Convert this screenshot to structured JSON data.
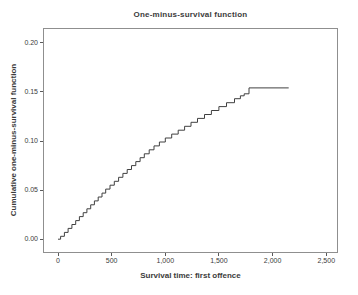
{
  "colors": {
    "curve": "#404040",
    "frame": "#8f8f8f",
    "tick": "#5a5a5a",
    "text": "#3b3b3b",
    "background": "#ffffff"
  },
  "chart_data": {
    "type": "line",
    "subtype": "step-function",
    "title": "One-minus-survival function",
    "xlabel": "Survival time: first offence",
    "ylabel": "Cumulative one-minus-survival function",
    "grid": false,
    "legend": null,
    "xlim": [
      -130,
      2600
    ],
    "ylim": [
      -0.013,
      0.214
    ],
    "x_ticks": [
      {
        "value": 0,
        "label": "0"
      },
      {
        "value": 500,
        "label": "500"
      },
      {
        "value": 1000,
        "label": "1,000"
      },
      {
        "value": 1500,
        "label": "1,500"
      },
      {
        "value": 2000,
        "label": "2,000"
      },
      {
        "value": 2500,
        "label": "2,500"
      }
    ],
    "y_ticks": [
      {
        "value": 0.0,
        "label": "0.00"
      },
      {
        "value": 0.05,
        "label": "0.05"
      },
      {
        "value": 0.1,
        "label": "0.10"
      },
      {
        "value": 0.15,
        "label": "0.15"
      },
      {
        "value": 0.2,
        "label": "0.20"
      }
    ],
    "series": [
      {
        "name": "One-minus-survival function",
        "style": "step-after",
        "points": [
          [
            0,
            0.0
          ],
          [
            25,
            0.003
          ],
          [
            60,
            0.007
          ],
          [
            95,
            0.011
          ],
          [
            130,
            0.015
          ],
          [
            165,
            0.019
          ],
          [
            200,
            0.023
          ],
          [
            235,
            0.027
          ],
          [
            270,
            0.031
          ],
          [
            305,
            0.035
          ],
          [
            340,
            0.039
          ],
          [
            375,
            0.043
          ],
          [
            410,
            0.047
          ],
          [
            445,
            0.051
          ],
          [
            485,
            0.055
          ],
          [
            525,
            0.059
          ],
          [
            565,
            0.063
          ],
          [
            605,
            0.067
          ],
          [
            645,
            0.071
          ],
          [
            685,
            0.075
          ],
          [
            725,
            0.079
          ],
          [
            765,
            0.083
          ],
          [
            805,
            0.087
          ],
          [
            850,
            0.091
          ],
          [
            895,
            0.095
          ],
          [
            945,
            0.099
          ],
          [
            1000,
            0.103
          ],
          [
            1060,
            0.107
          ],
          [
            1120,
            0.111
          ],
          [
            1180,
            0.115
          ],
          [
            1240,
            0.119
          ],
          [
            1300,
            0.123
          ],
          [
            1365,
            0.127
          ],
          [
            1430,
            0.131
          ],
          [
            1500,
            0.135
          ],
          [
            1570,
            0.139
          ],
          [
            1645,
            0.143
          ],
          [
            1700,
            0.146
          ],
          [
            1735,
            0.148
          ],
          [
            1780,
            0.154
          ],
          [
            2150,
            0.154
          ]
        ]
      }
    ]
  }
}
